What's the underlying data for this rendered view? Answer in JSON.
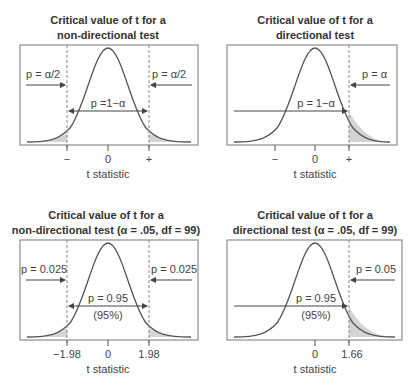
{
  "figure": {
    "panels": [
      {
        "id": "top-left",
        "title_line1": "Critical value of t for a",
        "title_line2": "non-directional test",
        "tail_label_left": "p = α/2",
        "tail_label_right": "p = α/2",
        "center_label": "p =1−α",
        "center_sublabel": "",
        "ticks": [
          "−",
          "0",
          "+"
        ],
        "xlabel": "t statistic"
      },
      {
        "id": "top-right",
        "title_line1": "Critical value of t for a",
        "title_line2": "directional test",
        "tail_label_right": "p = α",
        "center_label": "p = 1−α",
        "center_sublabel": "",
        "ticks": [
          "−",
          "0",
          "+"
        ],
        "xlabel": "t statistic"
      },
      {
        "id": "bottom-left",
        "title_line1": "Critical value of t for a",
        "title_line2": "non-directional test (α = .05, df = 99)",
        "tail_label_left": "p = 0.025",
        "tail_label_right": "p = 0.025",
        "center_label": "p = 0.95",
        "center_sublabel": "(95%)",
        "ticks": [
          "−1.98",
          "0",
          "1.98"
        ],
        "xlabel": "t statistic"
      },
      {
        "id": "bottom-right",
        "title_line1": "Critical value of t for a",
        "title_line2": "directional test (α = .05, df = 99)",
        "tail_label_right": "p = 0.05",
        "center_label": "p = 0.95",
        "center_sublabel": "(95%)",
        "ticks": [
          "0",
          "1.66"
        ],
        "xlabel": "t statistic"
      }
    ],
    "colors": {
      "curve": "#555555",
      "shade": "#d4d4d4",
      "box": "#777777",
      "dashed": "#888888",
      "arrow": "#444444"
    }
  }
}
